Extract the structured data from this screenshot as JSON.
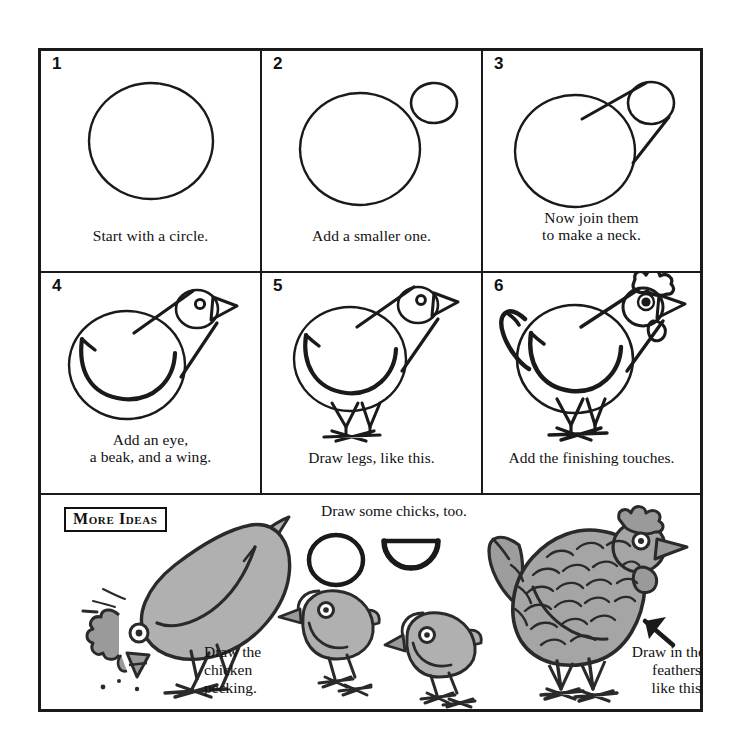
{
  "page": {
    "background_color": "#ffffff",
    "ink_color": "#1a1a1a",
    "fill_gray": "#a8a8a8"
  },
  "steps": [
    {
      "number": "1",
      "caption_lines": [
        "Start with a circle."
      ],
      "art": "big-circle"
    },
    {
      "number": "2",
      "caption_lines": [
        "Add a smaller one."
      ],
      "art": "big-circle-plus-small-circle"
    },
    {
      "number": "3",
      "caption_lines": [
        "Now join them",
        "to make a neck."
      ],
      "art": "circles-joined-neck"
    },
    {
      "number": "4",
      "caption_lines": [
        "Add an eye,",
        "a beak, and a wing."
      ],
      "art": "body-eye-beak-wing"
    },
    {
      "number": "5",
      "caption_lines": [
        "Draw legs, like this."
      ],
      "art": "body-with-legs"
    },
    {
      "number": "6",
      "caption_lines": [
        "Add the finishing touches."
      ],
      "art": "chicken-with-comb-wattle-tail"
    }
  ],
  "more_ideas": {
    "badge_label": "More Ideas",
    "chicks_label": "Draw some chicks, too.",
    "pecking_label_lines": [
      "Draw the",
      "chicken",
      "pecking."
    ],
    "feathers_label_lines": [
      "Draw in the",
      "feathers,",
      "like this."
    ],
    "drawings": [
      "pecking-chicken",
      "chick-starter-circle",
      "chick-starter-half-circle",
      "chick-left",
      "chick-right",
      "feathered-chicken",
      "pointer-arrow"
    ]
  }
}
